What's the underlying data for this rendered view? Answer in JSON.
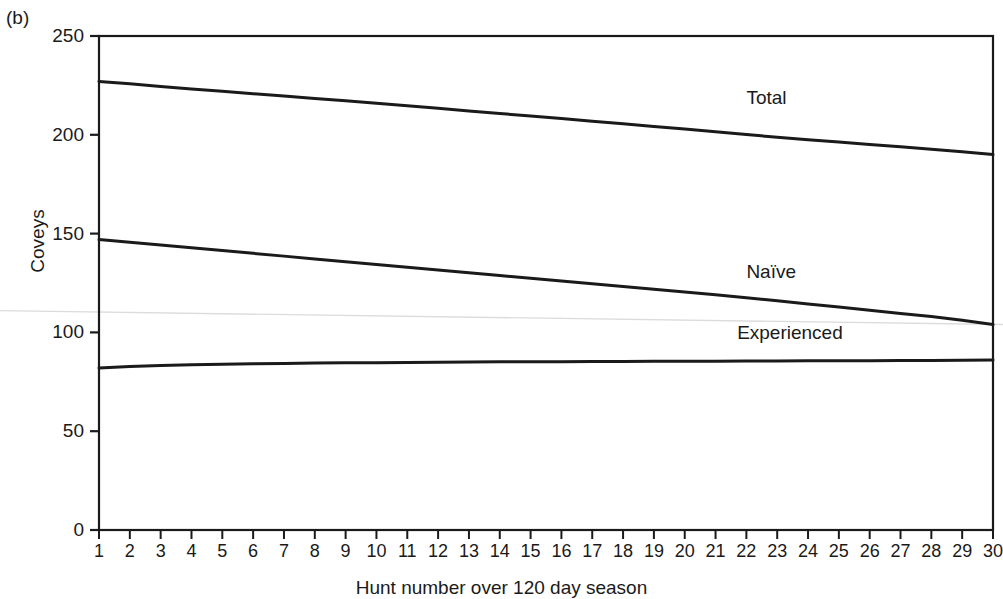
{
  "panel": {
    "label": "(b)"
  },
  "chart_data": {
    "type": "line",
    "title": "",
    "subtitle": "",
    "xlabel": "Hunt number over 120 day season",
    "ylabel": "Coveys",
    "xlim": [
      1,
      30
    ],
    "ylim": [
      0,
      250
    ],
    "yticks": [
      0,
      50,
      100,
      150,
      200,
      250
    ],
    "xticks": [
      1,
      2,
      3,
      4,
      5,
      6,
      7,
      8,
      9,
      10,
      11,
      12,
      13,
      14,
      15,
      16,
      17,
      18,
      19,
      20,
      21,
      22,
      23,
      24,
      25,
      26,
      27,
      28,
      29,
      30
    ],
    "grid": false,
    "legend_position": "inline-right-of-curves",
    "x": [
      1,
      2,
      3,
      4,
      5,
      6,
      7,
      8,
      9,
      10,
      11,
      12,
      13,
      14,
      15,
      16,
      17,
      18,
      19,
      20,
      21,
      22,
      23,
      24,
      25,
      26,
      27,
      28,
      29,
      30
    ],
    "series": [
      {
        "name": "Total",
        "color": "#1a1a1a",
        "label_x": 22,
        "label_y": 218,
        "values": [
          227,
          225.8,
          224.5,
          223.2,
          222.0,
          220.8,
          219.6,
          218.4,
          217.2,
          216.0,
          214.7,
          213.4,
          212.1,
          210.8,
          209.5,
          208.2,
          206.9,
          205.6,
          204.2,
          202.9,
          201.5,
          200.1,
          198.8,
          197.5,
          196.3,
          195.1,
          193.9,
          192.7,
          191.4,
          190.0
        ]
      },
      {
        "name": "Naïve",
        "color": "#1a1a1a",
        "label_x": 22,
        "label_y": 130,
        "values": [
          147,
          145.6,
          144.2,
          142.8,
          141.4,
          140.0,
          138.6,
          137.2,
          135.8,
          134.4,
          133.0,
          131.6,
          130.2,
          128.8,
          127.4,
          126.0,
          124.6,
          123.2,
          121.8,
          120.4,
          119.0,
          117.5,
          116.0,
          114.4,
          112.8,
          111.2,
          109.6,
          108.0,
          106.2,
          104.0
        ]
      },
      {
        "name": "Experienced",
        "color": "#1a1a1a",
        "label_x": 21.7,
        "label_y": 99,
        "values": [
          82.0,
          82.7,
          83.2,
          83.6,
          83.9,
          84.1,
          84.3,
          84.5,
          84.6,
          84.7,
          84.8,
          84.9,
          85.0,
          85.1,
          85.15,
          85.2,
          85.25,
          85.3,
          85.35,
          85.4,
          85.45,
          85.5,
          85.55,
          85.6,
          85.65,
          85.7,
          85.75,
          85.8,
          85.9,
          86.0
        ]
      }
    ],
    "artifact_line": {
      "name": "faint-scan-artifact",
      "color": "#dcdcdc",
      "y_left": 111,
      "y_right": 104
    }
  }
}
